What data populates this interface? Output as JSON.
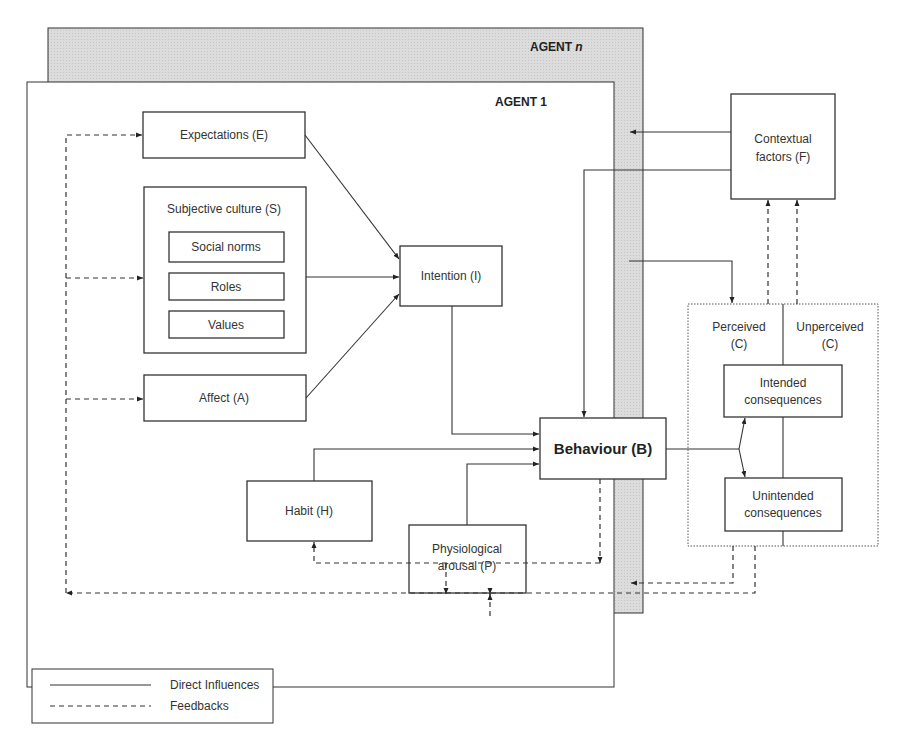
{
  "agents": {
    "agent_n": {
      "label_main": "AGENT ",
      "label_italic": "n"
    },
    "agent_1": {
      "label": "AGENT 1"
    }
  },
  "nodes": {
    "expectations": "Expectations (E)",
    "subjective_culture": {
      "title": "Subjective culture (S)",
      "items": [
        "Social norms",
        "Roles",
        "Values"
      ]
    },
    "affect": "Affect (A)",
    "intention": "Intention (I)",
    "behaviour": "Behaviour (B)",
    "habit": "Habit (H)",
    "physiological_arousal": {
      "line1": "Physiological",
      "line2": "arousal (P)"
    },
    "contextual_factors": {
      "line1": "Contextual",
      "line2": "factors (F)"
    },
    "consequences": {
      "perceived": {
        "line1": "Perceived",
        "line2": "(C)"
      },
      "unperceived": {
        "line1": "Unperceived",
        "line2": "(C)"
      },
      "intended": {
        "line1": "Intended",
        "line2": "consequences"
      },
      "unintended": {
        "line1": "Unintended",
        "line2": "consequences"
      }
    }
  },
  "legend": {
    "direct": "Direct Influences",
    "feedbacks": "Feedbacks"
  },
  "colors": {
    "agent_n_fill": "#d6d6d6",
    "stroke": "#333333",
    "background": "#ffffff"
  }
}
